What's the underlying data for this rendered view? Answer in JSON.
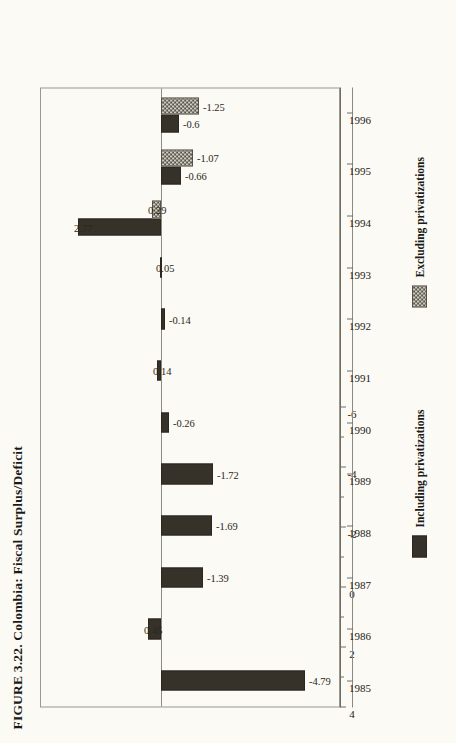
{
  "figure": {
    "title": "FIGURE 3.22. Colombia: Fiscal Surplus/Deficit"
  },
  "colors": {
    "including": "#36322a",
    "excluding": "#55514a",
    "excluding_fill": "#cdcabd",
    "page_background": "#fbfaf5",
    "frame": "#9a978d",
    "text": "#1c1a16"
  },
  "legend": {
    "position": "below-plot",
    "items": [
      {
        "label": "Including privatizations",
        "swatch": "solid-dark"
      },
      {
        "label": "Excluding privatizations",
        "swatch": "hatched-gray"
      }
    ]
  },
  "axes": {
    "value_ticks": [
      "4",
      "2",
      "0",
      "-2",
      "-4",
      "-6"
    ],
    "value_tick_values": [
      4,
      2,
      0,
      -2,
      -4,
      -6
    ],
    "value_minor_values": [
      3,
      1,
      -1,
      -3,
      -5
    ],
    "category_ticks": [
      "1985",
      "1986",
      "1987",
      "1988",
      "1989",
      "1990",
      "1991",
      "1992",
      "1993",
      "1994",
      "1995",
      "1996"
    ]
  },
  "chart_data": {
    "type": "bar",
    "orientation": "vertical-rotated",
    "title": "FIGURE 3.22. Colombia: Fiscal Surplus/Deficit",
    "xlabel": "",
    "ylabel": "",
    "ylim": [
      -6,
      4
    ],
    "grid": false,
    "legend_position": "below",
    "categories": [
      "1985",
      "1986",
      "1987",
      "1988",
      "1989",
      "1990",
      "1991",
      "1992",
      "1993",
      "1994",
      "1995",
      "1996"
    ],
    "series": [
      {
        "name": "Including privatizations",
        "values": [
          -4.79,
          0.45,
          -1.39,
          -1.69,
          -1.72,
          -0.26,
          0.14,
          -0.14,
          0.05,
          2.77,
          -0.66,
          -0.6
        ]
      },
      {
        "name": "Excluding privatizations",
        "values": [
          null,
          null,
          null,
          null,
          null,
          null,
          null,
          null,
          null,
          0.29,
          -1.07,
          -1.25
        ]
      }
    ],
    "data_labels": [
      {
        "category": "1985",
        "series": "Including privatizations",
        "text": "-4.79",
        "value": -4.79
      },
      {
        "category": "1986",
        "series": "Including privatizations",
        "text": "0.45",
        "value": 0.45
      },
      {
        "category": "1987",
        "series": "Including privatizations",
        "text": "-1.39",
        "value": -1.39
      },
      {
        "category": "1988",
        "series": "Including privatizations",
        "text": "-1.69",
        "value": -1.69
      },
      {
        "category": "1989",
        "series": "Including privatizations",
        "text": "-1.72",
        "value": -1.72
      },
      {
        "category": "1990",
        "series": "Including privatizations",
        "text": "-0.26",
        "value": -0.26
      },
      {
        "category": "1991",
        "series": "Including privatizations",
        "text": "0.14",
        "value": 0.14
      },
      {
        "category": "1992",
        "series": "Including privatizations",
        "text": "-0.14",
        "value": -0.14
      },
      {
        "category": "1993",
        "series": "Including privatizations",
        "text": "0.05",
        "value": 0.05
      },
      {
        "category": "1994",
        "series": "Including privatizations",
        "text": "2.77",
        "value": 2.77
      },
      {
        "category": "1994",
        "series": "Excluding privatizations",
        "text": "0.29",
        "value": 0.29
      },
      {
        "category": "1995",
        "series": "Including privatizations",
        "text": "-0.66",
        "value": -0.66
      },
      {
        "category": "1995",
        "series": "Excluding privatizations",
        "text": "-1.07",
        "value": -1.07
      },
      {
        "category": "1996",
        "series": "Including privatizations",
        "text": "-0.6",
        "value": -0.6
      },
      {
        "category": "1996",
        "series": "Excluding privatizations",
        "text": "-1.25",
        "value": -1.25
      }
    ]
  }
}
